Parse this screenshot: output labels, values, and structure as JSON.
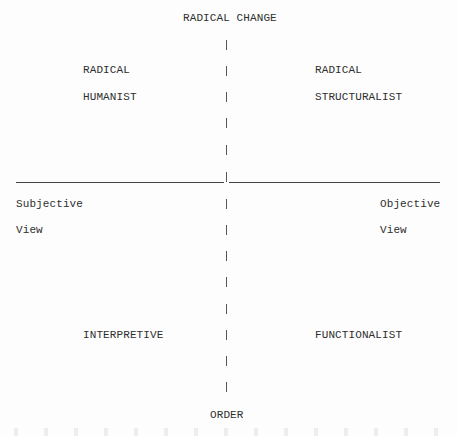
{
  "diagram": {
    "axes": {
      "top": "RADICAL CHANGE",
      "bottom": "ORDER",
      "left": {
        "line1": "Subjective",
        "line2": "View"
      },
      "right": {
        "line1": "Objective",
        "line2": "View"
      }
    },
    "quadrants": {
      "top_left": {
        "line1": "RADICAL",
        "line2": "HUMANIST"
      },
      "top_right": {
        "line1": "RADICAL",
        "line2": "STRUCTURALIST"
      },
      "bottom_left": {
        "line1": "INTERPRETIVE"
      },
      "bottom_right": {
        "line1": "FUNCTIONALIST"
      }
    },
    "colors": {
      "text": "#2e2e2e",
      "lines": "#444444",
      "background": "#fdfdfd"
    }
  }
}
